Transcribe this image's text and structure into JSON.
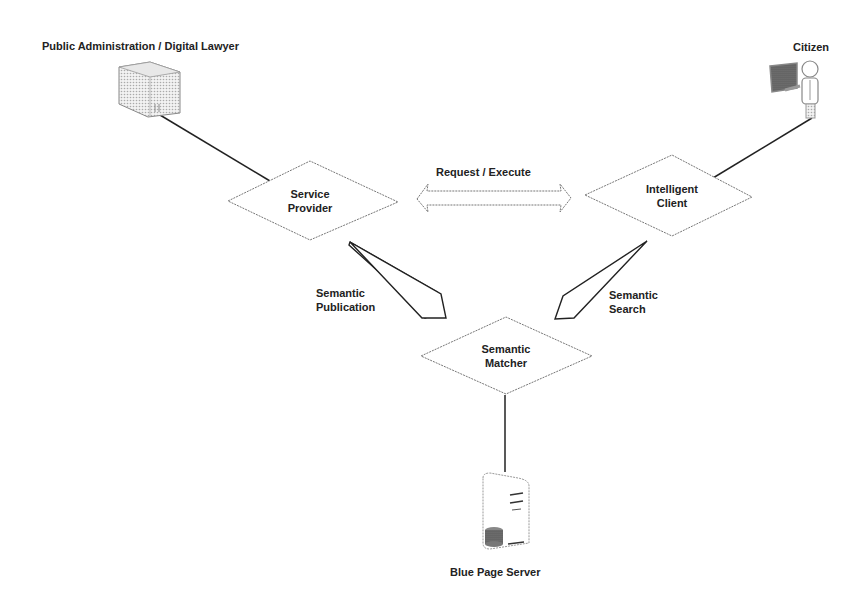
{
  "diagram": {
    "actors": {
      "public_admin": {
        "label": "Public Administration / Digital Lawyer",
        "icon": "building-icon"
      },
      "citizen": {
        "label": "Citizen",
        "icon": "person-computer-icon"
      },
      "blue_page_server": {
        "label": "Blue Page Server",
        "icon": "server-icon"
      }
    },
    "nodes": {
      "service_provider": {
        "line1": "Service",
        "line2": "Provider"
      },
      "intelligent_client": {
        "line1": "Intelligent",
        "line2": "Client"
      },
      "semantic_matcher": {
        "line1": "Semantic",
        "line2": "Matcher"
      }
    },
    "edges": {
      "request_execute": {
        "label": "Request / Execute",
        "type": "double-arrow"
      },
      "semantic_publication": {
        "line1": "Semantic",
        "line2": "Publication",
        "type": "arrow"
      },
      "semantic_search": {
        "line1": "Semantic",
        "line2": "Search",
        "type": "arrow"
      }
    }
  }
}
